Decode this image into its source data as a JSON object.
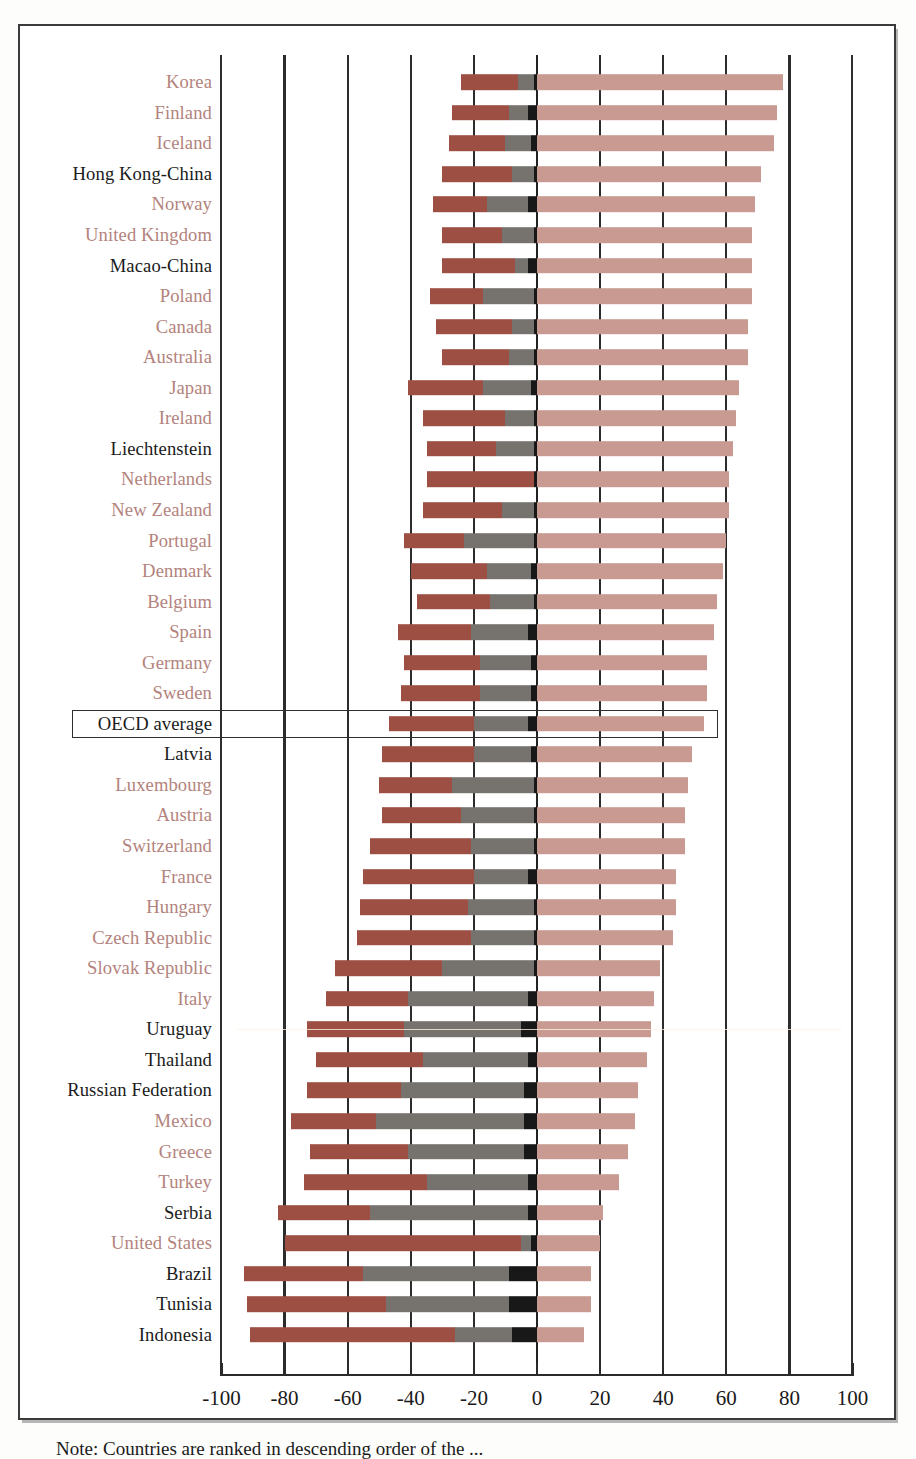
{
  "figure": {
    "note": "Note: Countries are ranked in descending order of the ...",
    "highlight_row_label": "OECD average"
  },
  "axis": {
    "ticks": [
      -100,
      -80,
      -60,
      -40,
      -20,
      0,
      20,
      40,
      60,
      80,
      100
    ],
    "tick_labels": [
      "-100",
      "-80",
      "-60",
      "-40",
      "-20",
      "0",
      "20",
      "40",
      "60",
      "80",
      "100"
    ],
    "min": -100,
    "max": 100
  },
  "colors": {
    "dark_red": "#9d4f43",
    "gray": "#76736f",
    "black": "#181818",
    "pink": "#c99a91",
    "oecd_label": "#b3837d",
    "partner_label": "#1b1b1b",
    "axis": "#2b2b2b",
    "frame": "#3a3a3a"
  },
  "chart_data": {
    "type": "bar",
    "orientation": "horizontal",
    "subtype": "diverging-stacked",
    "title": "",
    "xlabel": "",
    "ylabel": "",
    "xlim": [
      -100,
      100
    ],
    "grid": true,
    "gridlines_at": [
      -100,
      -80,
      -60,
      -40,
      -20,
      0,
      20,
      40,
      60,
      80,
      100
    ],
    "legend": [],
    "series": [
      {
        "name": "dark-red-left",
        "color": "#9d4f43"
      },
      {
        "name": "gray-left",
        "color": "#76736f"
      },
      {
        "name": "black-left",
        "color": "#181818"
      },
      {
        "name": "pink-right",
        "color": "#c99a91"
      }
    ],
    "categories": [
      "Korea",
      "Finland",
      "Iceland",
      "Hong Kong-China",
      "Norway",
      "United Kingdom",
      "Macao-China",
      "Poland",
      "Canada",
      "Australia",
      "Japan",
      "Ireland",
      "Liechtenstein",
      "Netherlands",
      "New Zealand",
      "Portugal",
      "Denmark",
      "Belgium",
      "Spain",
      "Germany",
      "Sweden",
      "OECD average",
      "Latvia",
      "Luxembourg",
      "Austria",
      "Switzerland",
      "France",
      "Hungary",
      "Czech Republic",
      "Slovak Republic",
      "Italy",
      "Uruguay",
      "Thailand",
      "Russian Federation",
      "Mexico",
      "Greece",
      "Turkey",
      "Serbia",
      "United States",
      "Brazil",
      "Tunisia",
      "Indonesia"
    ],
    "rows": [
      {
        "label": "Korea",
        "group": "oecd",
        "red_start": -24,
        "red_end": -6,
        "gray_start": -6,
        "gray_end": -1,
        "black_start": -1,
        "black_end": 0,
        "pink_end": 78
      },
      {
        "label": "Finland",
        "group": "oecd",
        "red_start": -27,
        "red_end": -9,
        "gray_start": -9,
        "gray_end": -3,
        "black_start": -3,
        "black_end": 0,
        "pink_end": 76
      },
      {
        "label": "Iceland",
        "group": "oecd",
        "red_start": -28,
        "red_end": -10,
        "gray_start": -10,
        "gray_end": -2,
        "black_start": -2,
        "black_end": 0,
        "pink_end": 75
      },
      {
        "label": "Hong Kong-China",
        "group": "partner",
        "red_start": -30,
        "red_end": -8,
        "gray_start": -8,
        "gray_end": -1,
        "black_start": -1,
        "black_end": 0,
        "pink_end": 71
      },
      {
        "label": "Norway",
        "group": "oecd",
        "red_start": -33,
        "red_end": -16,
        "gray_start": -16,
        "gray_end": -3,
        "black_start": -3,
        "black_end": 0,
        "pink_end": 69
      },
      {
        "label": "United Kingdom",
        "group": "oecd",
        "red_start": -30,
        "red_end": -11,
        "gray_start": -11,
        "gray_end": -1,
        "black_start": -1,
        "black_end": 0,
        "pink_end": 68
      },
      {
        "label": "Macao-China",
        "group": "partner",
        "red_start": -30,
        "red_end": -7,
        "gray_start": -7,
        "gray_end": -3,
        "black_start": -3,
        "black_end": 0,
        "pink_end": 68
      },
      {
        "label": "Poland",
        "group": "oecd",
        "red_start": -34,
        "red_end": -17,
        "gray_start": -17,
        "gray_end": -1,
        "black_start": -1,
        "black_end": 0,
        "pink_end": 68
      },
      {
        "label": "Canada",
        "group": "oecd",
        "red_start": -32,
        "red_end": -8,
        "gray_start": -8,
        "gray_end": -1,
        "black_start": -1,
        "black_end": 0,
        "pink_end": 67
      },
      {
        "label": "Australia",
        "group": "oecd",
        "red_start": -30,
        "red_end": -9,
        "gray_start": -9,
        "gray_end": -1,
        "black_start": -1,
        "black_end": 0,
        "pink_end": 67
      },
      {
        "label": "Japan",
        "group": "oecd",
        "red_start": -41,
        "red_end": -17,
        "gray_start": -17,
        "gray_end": -2,
        "black_start": -2,
        "black_end": 0,
        "pink_end": 64
      },
      {
        "label": "Ireland",
        "group": "oecd",
        "red_start": -36,
        "red_end": -10,
        "gray_start": -10,
        "gray_end": -1,
        "black_start": -1,
        "black_end": 0,
        "pink_end": 63
      },
      {
        "label": "Liechtenstein",
        "group": "partner",
        "red_start": -35,
        "red_end": -13,
        "gray_start": -13,
        "gray_end": -1,
        "black_start": -1,
        "black_end": 0,
        "pink_end": 62
      },
      {
        "label": "Netherlands",
        "group": "oecd",
        "red_start": -35,
        "red_end": -1,
        "gray_start": -1,
        "gray_end": -1,
        "black_start": -1,
        "black_end": 0,
        "pink_end": 61
      },
      {
        "label": "New Zealand",
        "group": "oecd",
        "red_start": -36,
        "red_end": -11,
        "gray_start": -11,
        "gray_end": -1,
        "black_start": -1,
        "black_end": 0,
        "pink_end": 61
      },
      {
        "label": "Portugal",
        "group": "oecd",
        "red_start": -42,
        "red_end": -23,
        "gray_start": -23,
        "gray_end": -1,
        "black_start": -1,
        "black_end": 0,
        "pink_end": 60
      },
      {
        "label": "Denmark",
        "group": "oecd",
        "red_start": -40,
        "red_end": -16,
        "gray_start": -16,
        "gray_end": -2,
        "black_start": -2,
        "black_end": 0,
        "pink_end": 59
      },
      {
        "label": "Belgium",
        "group": "oecd",
        "red_start": -38,
        "red_end": -15,
        "gray_start": -15,
        "gray_end": -1,
        "black_start": -1,
        "black_end": 0,
        "pink_end": 57
      },
      {
        "label": "Spain",
        "group": "oecd",
        "red_start": -44,
        "red_end": -21,
        "gray_start": -21,
        "gray_end": -3,
        "black_start": -3,
        "black_end": 0,
        "pink_end": 56
      },
      {
        "label": "Germany",
        "group": "oecd",
        "red_start": -42,
        "red_end": -18,
        "gray_start": -18,
        "gray_end": -2,
        "black_start": -2,
        "black_end": 0,
        "pink_end": 54
      },
      {
        "label": "Sweden",
        "group": "oecd",
        "red_start": -43,
        "red_end": -18,
        "gray_start": -18,
        "gray_end": -2,
        "black_start": -2,
        "black_end": 0,
        "pink_end": 54
      },
      {
        "label": "OECD average",
        "group": "average",
        "red_start": -47,
        "red_end": -20,
        "gray_start": -20,
        "gray_end": -3,
        "black_start": -3,
        "black_end": 0,
        "pink_end": 53
      },
      {
        "label": "Latvia",
        "group": "partner",
        "red_start": -49,
        "red_end": -20,
        "gray_start": -20,
        "gray_end": -2,
        "black_start": -2,
        "black_end": 0,
        "pink_end": 49
      },
      {
        "label": "Luxembourg",
        "group": "oecd",
        "red_start": -50,
        "red_end": -27,
        "gray_start": -27,
        "gray_end": -1,
        "black_start": -1,
        "black_end": 0,
        "pink_end": 48
      },
      {
        "label": "Austria",
        "group": "oecd",
        "red_start": -49,
        "red_end": -24,
        "gray_start": -24,
        "gray_end": -1,
        "black_start": -1,
        "black_end": 0,
        "pink_end": 47
      },
      {
        "label": "Switzerland",
        "group": "oecd",
        "red_start": -53,
        "red_end": -21,
        "gray_start": -21,
        "gray_end": -1,
        "black_start": -1,
        "black_end": 0,
        "pink_end": 47
      },
      {
        "label": "France",
        "group": "oecd",
        "red_start": -55,
        "red_end": -20,
        "gray_start": -20,
        "gray_end": -3,
        "black_start": -3,
        "black_end": 0,
        "pink_end": 44
      },
      {
        "label": "Hungary",
        "group": "oecd",
        "red_start": -56,
        "red_end": -22,
        "gray_start": -22,
        "gray_end": -1,
        "black_start": -1,
        "black_end": 0,
        "pink_end": 44
      },
      {
        "label": "Czech Republic",
        "group": "oecd",
        "red_start": -57,
        "red_end": -21,
        "gray_start": -21,
        "gray_end": -1,
        "black_start": -1,
        "black_end": 0,
        "pink_end": 43
      },
      {
        "label": "Slovak Republic",
        "group": "oecd",
        "red_start": -64,
        "red_end": -30,
        "gray_start": -30,
        "gray_end": -1,
        "black_start": -1,
        "black_end": 0,
        "pink_end": 39
      },
      {
        "label": "Italy",
        "group": "oecd",
        "red_start": -67,
        "red_end": -41,
        "gray_start": -41,
        "gray_end": -3,
        "black_start": -3,
        "black_end": 0,
        "pink_end": 37
      },
      {
        "label": "Uruguay",
        "group": "partner",
        "red_start": -73,
        "red_end": -42,
        "gray_start": -42,
        "gray_end": -5,
        "black_start": -5,
        "black_end": 0,
        "pink_end": 36
      },
      {
        "label": "Thailand",
        "group": "partner",
        "red_start": -70,
        "red_end": -36,
        "gray_start": -36,
        "gray_end": -3,
        "black_start": -3,
        "black_end": 0,
        "pink_end": 35
      },
      {
        "label": "Russian Federation",
        "group": "partner",
        "red_start": -73,
        "red_end": -43,
        "gray_start": -43,
        "gray_end": -4,
        "black_start": -4,
        "black_end": 0,
        "pink_end": 32
      },
      {
        "label": "Mexico",
        "group": "oecd",
        "red_start": -78,
        "red_end": -51,
        "gray_start": -51,
        "gray_end": -4,
        "black_start": -4,
        "black_end": 0,
        "pink_end": 31
      },
      {
        "label": "Greece",
        "group": "oecd",
        "red_start": -72,
        "red_end": -41,
        "gray_start": -41,
        "gray_end": -4,
        "black_start": -4,
        "black_end": 0,
        "pink_end": 29
      },
      {
        "label": "Turkey",
        "group": "oecd",
        "red_start": -74,
        "red_end": -35,
        "gray_start": -35,
        "gray_end": -3,
        "black_start": -3,
        "black_end": 0,
        "pink_end": 26
      },
      {
        "label": "Serbia",
        "group": "partner",
        "red_start": -82,
        "red_end": -53,
        "gray_start": -53,
        "gray_end": -3,
        "black_start": -3,
        "black_end": 0,
        "pink_end": 21
      },
      {
        "label": "United States",
        "group": "oecd",
        "red_start": -80,
        "red_end": -5,
        "gray_start": -5,
        "gray_end": -2,
        "black_start": -2,
        "black_end": 0,
        "pink_end": 20
      },
      {
        "label": "Brazil",
        "group": "partner",
        "red_start": -93,
        "red_end": -55,
        "gray_start": -55,
        "gray_end": -9,
        "black_start": -9,
        "black_end": 0,
        "pink_end": 17
      },
      {
        "label": "Tunisia",
        "group": "partner",
        "red_start": -92,
        "red_end": -48,
        "gray_start": -48,
        "gray_end": -9,
        "black_start": -9,
        "black_end": 0,
        "pink_end": 17
      },
      {
        "label": "Indonesia",
        "group": "partner",
        "red_start": -91,
        "red_end": -26,
        "gray_start": -26,
        "gray_end": -8,
        "black_start": -8,
        "black_end": 0,
        "pink_end": 15
      }
    ]
  }
}
